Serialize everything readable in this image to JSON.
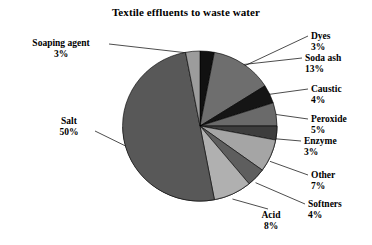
{
  "chart_data": {
    "type": "pie",
    "title": "Textile effluents to waste water",
    "xlabel": "",
    "ylabel": "",
    "legend": "none",
    "labels": [
      "Dyes",
      "Soda ash",
      "Caustic",
      "Peroxide",
      "Enzyme",
      "Other",
      "Softners",
      "Acid",
      "Salt",
      "Soaping agent"
    ],
    "values": [
      3,
      13,
      4,
      5,
      3,
      7,
      4,
      8,
      50,
      3
    ],
    "value_suffix": "%",
    "slices": [
      {
        "name": "Dyes",
        "value": 3,
        "pct_text": "3%",
        "color": "#111111"
      },
      {
        "name": "Soda ash",
        "value": 13,
        "pct_text": "13%",
        "color": "#6e6e6e"
      },
      {
        "name": "Caustic",
        "value": 4,
        "pct_text": "4%",
        "color": "#151515"
      },
      {
        "name": "Peroxide",
        "value": 5,
        "pct_text": "5%",
        "color": "#6a6a6a"
      },
      {
        "name": "Enzyme",
        "value": 3,
        "pct_text": "3%",
        "color": "#3d3d3d"
      },
      {
        "name": "Other",
        "value": 7,
        "pct_text": "7%",
        "color": "#a5a5a5"
      },
      {
        "name": "Softners",
        "value": 4,
        "pct_text": "4%",
        "color": "#5e5e5e"
      },
      {
        "name": "Acid",
        "value": 8,
        "pct_text": "8%",
        "color": "#b0b0b0"
      },
      {
        "name": "Salt",
        "value": 50,
        "pct_text": "50%",
        "color": "#585858"
      },
      {
        "name": "Soaping agent",
        "value": 3,
        "pct_text": "3%",
        "color": "#9c9c9c"
      }
    ]
  },
  "labels": {
    "soaping_agent": {
      "name": "Soaping agent",
      "pct": "3%"
    },
    "dyes": {
      "name": "Dyes",
      "pct": "3%"
    },
    "soda_ash": {
      "name": "Soda ash",
      "pct": "13%"
    },
    "caustic": {
      "name": "Caustic",
      "pct": "4%"
    },
    "peroxide": {
      "name": "Peroxide",
      "pct": "5%"
    },
    "enzyme": {
      "name": "Enzyme",
      "pct": "3%"
    },
    "other": {
      "name": "Other",
      "pct": "7%"
    },
    "softners": {
      "name": "Softners",
      "pct": "4%"
    },
    "acid": {
      "name": "Acid",
      "pct": "8%"
    },
    "salt": {
      "name": "Salt",
      "pct": "50%"
    }
  },
  "colors": {
    "background": "#ffffff",
    "text": "#000000",
    "leader_line": "#000000",
    "pie_outline": "#000000"
  }
}
